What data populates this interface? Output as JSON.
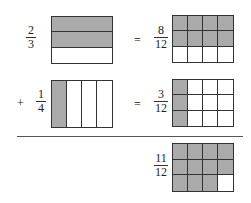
{
  "diagram": {
    "operators": {
      "equals": "=",
      "plus": "+"
    },
    "colors": {
      "shaded": "#aaaaaa",
      "unshaded": "#ffffff",
      "line": "#333333"
    },
    "rows": [
      {
        "left": {
          "num": "2",
          "den": "3",
          "grid": {
            "rows": 3,
            "cols": 1,
            "shaded": [
              0,
              1
            ]
          }
        },
        "right": {
          "num": "8",
          "den": "12",
          "grid": {
            "rows": 3,
            "cols": 4,
            "shaded": [
              0,
              1,
              2,
              3,
              4,
              5,
              6,
              7
            ]
          }
        }
      },
      {
        "left": {
          "num": "1",
          "den": "4",
          "grid": {
            "rows": 1,
            "cols": 4,
            "shaded": [
              0
            ]
          }
        },
        "right": {
          "num": "3",
          "den": "12",
          "grid": {
            "rows": 3,
            "cols": 4,
            "shaded": [
              0,
              4,
              8
            ]
          }
        }
      }
    ],
    "result": {
      "num": "11",
      "den": "12",
      "grid": {
        "rows": 3,
        "cols": 4,
        "shaded": [
          0,
          1,
          2,
          3,
          4,
          5,
          6,
          7,
          8,
          9,
          10
        ]
      }
    }
  }
}
